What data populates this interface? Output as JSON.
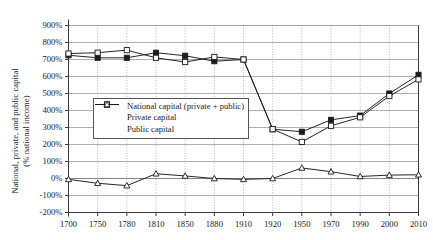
{
  "chart_data": {
    "type": "line",
    "title": "",
    "xlabel": "",
    "ylabel_line1": "National, private, and public capital",
    "ylabel_line2": "(% national income)",
    "categories": [
      "1700",
      "1750",
      "1780",
      "1810",
      "1850",
      "1880",
      "1910",
      "1920",
      "1950",
      "1970",
      "1990",
      "2000",
      "2010"
    ],
    "ylim": [
      -200,
      900
    ],
    "yticks": [
      "900%",
      "800%",
      "700%",
      "600%",
      "500%",
      "400%",
      "300%",
      "200%",
      "100%",
      "0%",
      "-100%",
      "-200%"
    ],
    "ytick_values": [
      900,
      800,
      700,
      600,
      500,
      400,
      300,
      200,
      100,
      0,
      -100,
      -200
    ],
    "grid": "horizontal-solid-vertical-dotted",
    "legend_position": "center-left",
    "series": [
      {
        "name": "National capital (private + public)",
        "marker": "filled-square",
        "values": [
          725,
          710,
          710,
          740,
          722,
          690,
          700,
          290,
          275,
          345,
          370,
          500,
          610
        ]
      },
      {
        "name": "Private capital",
        "marker": "open-square",
        "values": [
          735,
          740,
          755,
          710,
          685,
          715,
          700,
          290,
          215,
          310,
          360,
          485,
          583
        ]
      },
      {
        "name": "Public capital",
        "marker": "open-triangle",
        "values": [
          -5,
          -28,
          -42,
          28,
          15,
          0,
          -5,
          0,
          62,
          40,
          12,
          20,
          22
        ]
      }
    ]
  },
  "legend": {
    "items": [
      {
        "label": "National capital (private + public)"
      },
      {
        "label": "Private capital"
      },
      {
        "label": "Public capital"
      }
    ]
  },
  "colors": {
    "line": "#1a1a1a",
    "grid_horizontal": "#8d8d8d",
    "grid_vertical": "#9a9a9a",
    "axis": "#4a4a4a",
    "background": "#ffffff"
  }
}
